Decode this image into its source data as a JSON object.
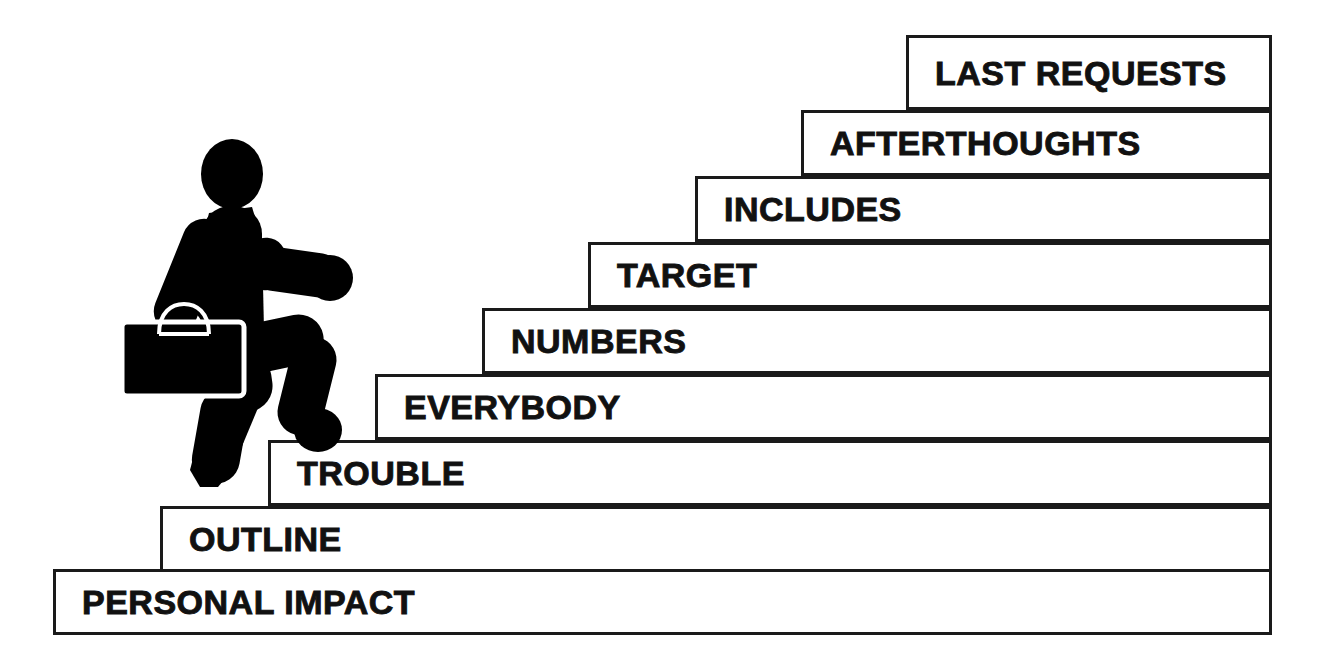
{
  "diagram": {
    "type": "staircase",
    "orientation": "ascending-left-to-right",
    "background_color": "#ffffff",
    "line_color": "#1a1a1a",
    "text_color": "#111111",
    "figure": {
      "icon_name": "businessman-climbing-stairs",
      "color": "#000000",
      "accessories": [
        "briefcase"
      ]
    },
    "steps": [
      {
        "index": 1,
        "label": "PERSONAL IMPACT",
        "left": 53,
        "top": 569,
        "width": 1219,
        "height": 66
      },
      {
        "index": 2,
        "label": "OUTLINE",
        "left": 160,
        "top": 506,
        "width": 1112,
        "height": 66
      },
      {
        "index": 3,
        "label": "TROUBLE",
        "left": 268,
        "top": 440,
        "width": 1004,
        "height": 66
      },
      {
        "index": 4,
        "label": "EVERYBODY",
        "left": 375,
        "top": 374,
        "width": 897,
        "height": 66
      },
      {
        "index": 5,
        "label": "NUMBERS",
        "left": 482,
        "top": 308,
        "width": 790,
        "height": 66
      },
      {
        "index": 6,
        "label": "TARGET",
        "left": 588,
        "top": 242,
        "width": 684,
        "height": 66
      },
      {
        "index": 7,
        "label": "INCLUDES",
        "left": 695,
        "top": 176,
        "width": 577,
        "height": 66
      },
      {
        "index": 8,
        "label": "AFTERTHOUGHTS",
        "left": 801,
        "top": 110,
        "width": 471,
        "height": 66
      },
      {
        "index": 9,
        "label": "LAST REQUESTS",
        "left": 906,
        "top": 35,
        "width": 366,
        "height": 75
      }
    ]
  }
}
